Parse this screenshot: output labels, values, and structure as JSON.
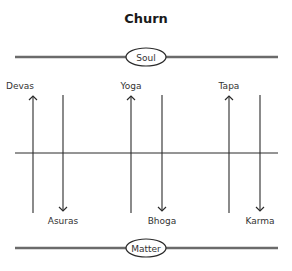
{
  "title": "Churn",
  "top_bar": {
    "label": "Soul"
  },
  "bottom_bar": {
    "label": "Matter"
  },
  "pairs": [
    {
      "up_label": "Devas",
      "down_label": "Asuras"
    },
    {
      "up_label": "Yoga",
      "down_label": "Bhoga"
    },
    {
      "up_label": "Tapa",
      "down_label": "Karma"
    }
  ],
  "colors": {
    "bar": "#6b6b6b",
    "line": "#2b2b2b",
    "text": "#333333"
  }
}
